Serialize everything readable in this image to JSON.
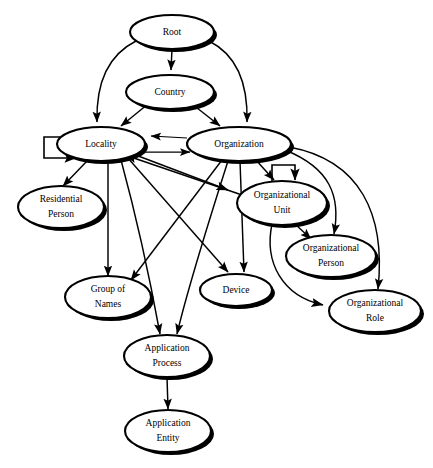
{
  "diagram": {
    "type": "directed-graph",
    "background_color": "#ffffff",
    "stroke_color": "#000000",
    "node_fill": "#ffffff",
    "nodes": [
      {
        "id": "root",
        "label": "Root",
        "lines": [
          "Root"
        ],
        "cx": 172,
        "cy": 32,
        "rx": 42,
        "ry": 17
      },
      {
        "id": "country",
        "label": "Country",
        "lines": [
          "Country"
        ],
        "cx": 170,
        "cy": 92,
        "rx": 44,
        "ry": 17
      },
      {
        "id": "locality",
        "label": "Locality",
        "lines": [
          "Locality"
        ],
        "cx": 101,
        "cy": 144,
        "rx": 44,
        "ry": 17
      },
      {
        "id": "organization",
        "label": "Organization",
        "lines": [
          "Organization"
        ],
        "cx": 239,
        "cy": 144,
        "rx": 52,
        "ry": 17
      },
      {
        "id": "residential-person",
        "label": "Residential Person",
        "lines": [
          "Residential",
          "Person"
        ],
        "cx": 61,
        "cy": 207,
        "rx": 43,
        "ry": 21
      },
      {
        "id": "organizational-unit",
        "label": "Organizational Unit",
        "lines": [
          "Organizational",
          "Unit"
        ],
        "cx": 282,
        "cy": 203,
        "rx": 45,
        "ry": 22
      },
      {
        "id": "organizational-person",
        "label": "Organizational Person",
        "lines": [
          "Organizational",
          "Person"
        ],
        "cx": 331,
        "cy": 256,
        "rx": 45,
        "ry": 21
      },
      {
        "id": "group-of-names",
        "label": "Group of Names",
        "lines": [
          "Group of",
          "Names"
        ],
        "cx": 108,
        "cy": 297,
        "rx": 43,
        "ry": 21
      },
      {
        "id": "device",
        "label": "Device",
        "lines": [
          "Device"
        ],
        "cx": 236,
        "cy": 290,
        "rx": 36,
        "ry": 16
      },
      {
        "id": "organizational-role",
        "label": "Organizational Role",
        "lines": [
          "Organizational",
          "Role"
        ],
        "cx": 375,
        "cy": 311,
        "rx": 46,
        "ry": 21
      },
      {
        "id": "application-process",
        "label": "Application Process",
        "lines": [
          "Application",
          "Process"
        ],
        "cx": 167,
        "cy": 356,
        "rx": 43,
        "ry": 21
      },
      {
        "id": "application-entity",
        "label": "Application Entity",
        "lines": [
          "Application",
          "Entity"
        ],
        "cx": 168,
        "cy": 431,
        "rx": 43,
        "ry": 21
      }
    ],
    "edges": [
      {
        "from": "root",
        "to": "country"
      },
      {
        "from": "root",
        "to": "locality"
      },
      {
        "from": "root",
        "to": "organization"
      },
      {
        "from": "country",
        "to": "locality"
      },
      {
        "from": "country",
        "to": "organization"
      },
      {
        "from": "locality",
        "to": "locality",
        "kind": "self-loop"
      },
      {
        "from": "organization",
        "to": "locality"
      },
      {
        "from": "locality",
        "to": "organization"
      },
      {
        "from": "locality",
        "to": "residential-person"
      },
      {
        "from": "locality",
        "to": "group-of-names"
      },
      {
        "from": "locality",
        "to": "device"
      },
      {
        "from": "locality",
        "to": "application-process"
      },
      {
        "from": "locality",
        "to": "organizational-unit"
      },
      {
        "from": "organization",
        "to": "organizational-unit"
      },
      {
        "from": "organization",
        "to": "group-of-names"
      },
      {
        "from": "organization",
        "to": "device"
      },
      {
        "from": "organization",
        "to": "application-process"
      },
      {
        "from": "organization",
        "to": "organizational-person"
      },
      {
        "from": "organization",
        "to": "organizational-role"
      },
      {
        "from": "organizational-unit",
        "to": "organizational-unit",
        "kind": "self-loop"
      },
      {
        "from": "organizational-unit",
        "to": "organizational-person"
      },
      {
        "from": "organizational-unit",
        "to": "organizational-role"
      },
      {
        "from": "organizational-unit",
        "to": "locality"
      },
      {
        "from": "application-process",
        "to": "application-entity"
      }
    ]
  }
}
